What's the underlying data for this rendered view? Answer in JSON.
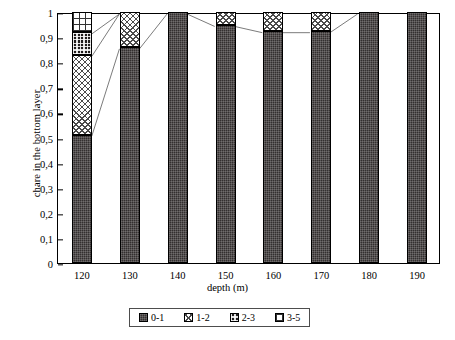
{
  "chart_data": {
    "type": "bar",
    "stacked": true,
    "title": "",
    "xlabel": "depth (m)",
    "ylabel": "chare in the bottom layer",
    "categories": [
      "120",
      "130",
      "140",
      "150",
      "160",
      "170",
      "180",
      "190"
    ],
    "ylim": [
      0,
      1
    ],
    "ytick_labels": [
      "0",
      "0,1",
      "0,2",
      "0,3",
      "0,4",
      "0,5",
      "0,6",
      "0,7",
      "0,8",
      "0,9",
      "1"
    ],
    "ytick_values": [
      0,
      0.1,
      0.2,
      0.3,
      0.4,
      0.5,
      0.6,
      0.7,
      0.8,
      0.9,
      1
    ],
    "grid": false,
    "legend_position": "bottom",
    "series": [
      {
        "name": "0-1",
        "pattern": "solid-dark",
        "values": [
          0.51,
          0.86,
          1.0,
          0.95,
          0.925,
          0.925,
          1.0,
          1.0
        ]
      },
      {
        "name": "1-2",
        "pattern": "light-crosshatch",
        "values": [
          0.32,
          0.14,
          0.0,
          0.05,
          0.075,
          0.075,
          0.0,
          0.0
        ]
      },
      {
        "name": "2-3",
        "pattern": "dark-checker",
        "values": [
          0.09,
          0.0,
          0.0,
          0.0,
          0.0,
          0.0,
          0.0,
          0.0
        ]
      },
      {
        "name": "3-5",
        "pattern": "white-grid",
        "values": [
          0.08,
          0.0,
          0.0,
          0.0,
          0.0,
          0.0,
          0.0,
          0.0
        ]
      }
    ],
    "connector_lines": true
  },
  "axis": {
    "y_label": "chare in the bottom layer",
    "x_label": "depth (m)"
  },
  "legend": {
    "items": [
      {
        "label": "0-1"
      },
      {
        "label": "1-2"
      },
      {
        "label": "2-3"
      },
      {
        "label": "3-5"
      }
    ]
  },
  "colors": {
    "axis": "#000000",
    "series_0_1": "#332f2f",
    "series_1_2": "#ffffff",
    "series_2_3": "#1f1c1c",
    "series_3_5": "#ffffff",
    "connector": "#6b6b6b"
  }
}
